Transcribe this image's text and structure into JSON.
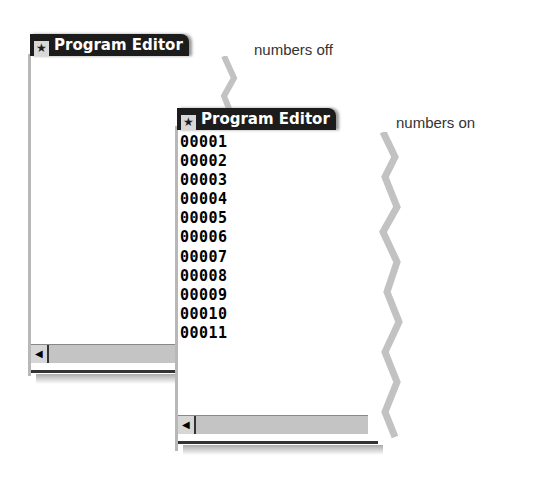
{
  "windows": [
    {
      "id": "numbers-off",
      "title": "Program Editor",
      "caption": "numbers off",
      "line_numbers": []
    },
    {
      "id": "numbers-on",
      "title": "Program Editor",
      "caption": "numbers on",
      "line_numbers": [
        "00001",
        "00002",
        "00003",
        "00004",
        "00005",
        "00006",
        "00007",
        "00008",
        "00009",
        "00010",
        "00011"
      ]
    }
  ],
  "icons": {
    "window_icon": "program-editor-icon",
    "scroll_left": "scroll-left-arrow-icon"
  },
  "glyphs": {
    "window_icon": "★",
    "scroll_left": "◀"
  },
  "colors": {
    "titlebar": "#1c1c1c",
    "scrollbar": "#c4c4c4",
    "frame": "#b8b8b8"
  }
}
